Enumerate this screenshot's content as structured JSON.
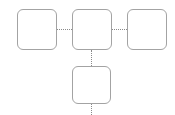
{
  "diagram": {
    "type": "org-tree",
    "colors": {
      "node_border": "#a3a3a3",
      "node_fill": "#ffffff",
      "edge": "#8a8a8a",
      "background": "#ffffff"
    },
    "nodes": [
      {
        "id": "node-left",
        "label": ""
      },
      {
        "id": "node-center",
        "label": ""
      },
      {
        "id": "node-right",
        "label": ""
      },
      {
        "id": "node-bottom",
        "label": ""
      }
    ],
    "edges": [
      {
        "from": "node-left",
        "to": "node-center",
        "style": "dotted"
      },
      {
        "from": "node-center",
        "to": "node-right",
        "style": "dotted"
      },
      {
        "from": "node-center",
        "to": "node-bottom",
        "style": "dotted"
      },
      {
        "from": "node-bottom",
        "to": "offscreen-below",
        "style": "dotted"
      }
    ]
  }
}
